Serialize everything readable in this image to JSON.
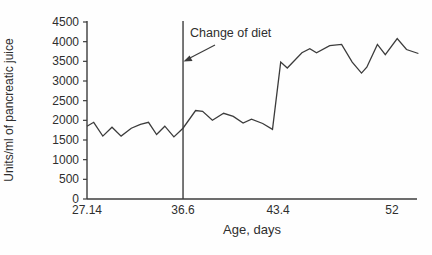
{
  "figure": {
    "background": "#fefefe"
  },
  "chart_data": {
    "type": "line",
    "title": "",
    "xlabel": "Age, days",
    "ylabel": "Units/ml of pancreatic juice",
    "ylim": [
      0,
      4500
    ],
    "grid": false,
    "legend": false,
    "axis_color": "#3c3c3c",
    "line_color": "#3c3c3c",
    "y_ticks": [
      0,
      500,
      1000,
      1500,
      2000,
      2500,
      3000,
      3500,
      4000,
      4500
    ],
    "x_ticks": [
      {
        "label": "27.14",
        "value": 27.14,
        "frac": 0.0
      },
      {
        "label": "36.6",
        "value": 36.6,
        "frac": 0.291
      },
      {
        "label": "43.4",
        "value": 43.4,
        "frac": 0.579
      },
      {
        "label": "52",
        "value": 52,
        "frac": 0.924
      }
    ],
    "annotation": {
      "text": "Change of diet",
      "x_value": 36.6
    },
    "series": [
      {
        "name": "pancreatic-juice-secretion",
        "points": [
          [
            27.14,
            1850
          ],
          [
            27.8,
            1950
          ],
          [
            28.7,
            1600
          ],
          [
            29.6,
            1825
          ],
          [
            30.5,
            1600
          ],
          [
            31.5,
            1800
          ],
          [
            32.4,
            1900
          ],
          [
            33.2,
            1950
          ],
          [
            34.0,
            1640
          ],
          [
            34.8,
            1850
          ],
          [
            35.7,
            1580
          ],
          [
            36.6,
            1800
          ],
          [
            37.5,
            2250
          ],
          [
            38.0,
            2230
          ],
          [
            38.7,
            2000
          ],
          [
            39.5,
            2180
          ],
          [
            40.2,
            2100
          ],
          [
            40.9,
            1930
          ],
          [
            41.5,
            2030
          ],
          [
            42.3,
            1920
          ],
          [
            43.0,
            1770
          ],
          [
            43.6,
            3480
          ],
          [
            44.1,
            3330
          ],
          [
            45.2,
            3720
          ],
          [
            45.8,
            3820
          ],
          [
            46.3,
            3720
          ],
          [
            47.3,
            3900
          ],
          [
            48.2,
            3930
          ],
          [
            49.0,
            3480
          ],
          [
            49.7,
            3200
          ],
          [
            50.1,
            3350
          ],
          [
            50.9,
            3930
          ],
          [
            51.5,
            3670
          ],
          [
            52.4,
            4080
          ],
          [
            53.1,
            3800
          ],
          [
            54.0,
            3700
          ]
        ]
      }
    ]
  }
}
